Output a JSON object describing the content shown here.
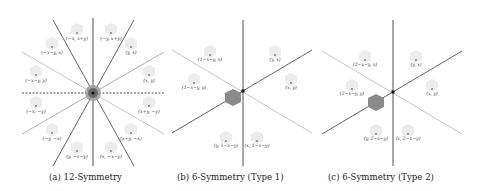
{
  "panels": [
    {
      "id": "a",
      "caption": "(a) 12-Symmetry",
      "labels": [
        "(−x, x+y)",
        "(−y, x+y)",
        "(−x−y, x)",
        "(y, x)",
        "(−x−y, y)",
        "(x, y)",
        "(−x, −y)",
        "(x+y, −y)",
        "(−y, −x)",
        "(x+y, −x)",
        "(y, −x−y)",
        "(x, −x−y)"
      ]
    },
    {
      "id": "b",
      "caption": "(b) 6-Symmetry (Type 1)",
      "labels": [
        "(1−x−y, x)",
        "(y, x)",
        "(1−x−y, y)",
        "(x, y)",
        "(y, 1−x−y)",
        "(x, 1−x−y)"
      ]
    },
    {
      "id": "c",
      "caption": "(c) 6-Symmetry (Type 2)",
      "labels": [
        "(2−x−y, x)",
        "(y, x)",
        "(2−x−y, y)",
        "(x, y)",
        "(y, 2−x−y)",
        "(x, 2−x−y)"
      ]
    }
  ],
  "colors": {
    "dark_line": "#3a3a3a",
    "light_line": "#b8b8b8",
    "hexagon_fill": "#8a8a8a",
    "ghost_hex": "#ececec",
    "center_dot": "#111111"
  }
}
